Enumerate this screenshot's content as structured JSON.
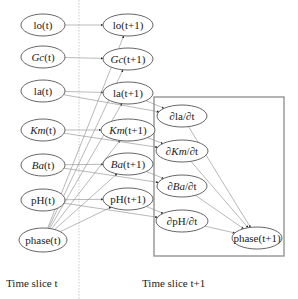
{
  "diagram": {
    "type": "dynamic-bayesian-network",
    "slice_labels": {
      "t": "Time slice t",
      "t_plus_1": "Time slice t+1"
    },
    "divider_x": 79,
    "box": {
      "x": 154,
      "y": 97,
      "w": 130,
      "h": 159
    },
    "colors": {
      "edge": "#8a8a8a",
      "node_stroke": "#555555",
      "box_stroke": "#8c8c8c",
      "background": "#ffffff"
    },
    "nodes": [
      {
        "id": "lo_t",
        "italic": "",
        "rest": "lo(t)",
        "cx": 43,
        "cy": 25,
        "rx": 22,
        "ry": 11
      },
      {
        "id": "Gc_t",
        "italic": "Gc",
        "rest": "(t)",
        "cx": 43,
        "cy": 57,
        "rx": 22,
        "ry": 11
      },
      {
        "id": "la_t",
        "italic": "",
        "rest": "la(t)",
        "cx": 43,
        "cy": 91,
        "rx": 22,
        "ry": 11
      },
      {
        "id": "Km_t",
        "italic": "Km",
        "rest": "(t)",
        "cx": 43,
        "cy": 130,
        "rx": 22,
        "ry": 11
      },
      {
        "id": "Ba_t",
        "italic": "Ba",
        "rest": "(t)",
        "cx": 43,
        "cy": 165,
        "rx": 22,
        "ry": 11
      },
      {
        "id": "pH_t",
        "italic": "",
        "rest": "pH(t)",
        "cx": 43,
        "cy": 200,
        "rx": 22,
        "ry": 11
      },
      {
        "id": "phase_t",
        "italic": "",
        "rest": "phase(t)",
        "cx": 43,
        "cy": 240,
        "rx": 24,
        "ry": 12
      },
      {
        "id": "lo_t1",
        "italic": "",
        "rest": "lo(t+1)",
        "cx": 128,
        "cy": 25,
        "rx": 25,
        "ry": 11
      },
      {
        "id": "Gc_t1",
        "italic": "Gc",
        "rest": "(t+1)",
        "cx": 128,
        "cy": 59,
        "rx": 25,
        "ry": 11
      },
      {
        "id": "la_t1",
        "italic": "",
        "rest": "la(t+1)",
        "cx": 128,
        "cy": 93,
        "rx": 25,
        "ry": 11
      },
      {
        "id": "Km_t1",
        "italic": "Km",
        "rest": "(t+1)",
        "cx": 128,
        "cy": 130,
        "rx": 27,
        "ry": 11
      },
      {
        "id": "Ba_t1",
        "italic": "Ba",
        "rest": "(t+1)",
        "cx": 128,
        "cy": 164,
        "rx": 25,
        "ry": 11
      },
      {
        "id": "pH_t1",
        "italic": "",
        "rest": "pH(t+1)",
        "cx": 128,
        "cy": 199,
        "rx": 25,
        "ry": 11
      },
      {
        "id": "dla",
        "italic": "",
        "rest": "∂la/∂t",
        "pre": "",
        "cx": 182,
        "cy": 116,
        "rx": 25,
        "ry": 11
      },
      {
        "id": "dKm",
        "italic": "Km",
        "pre": "∂",
        "rest": "/∂t",
        "cx": 182,
        "cy": 151,
        "rx": 26,
        "ry": 11
      },
      {
        "id": "dBa",
        "italic": "Ba",
        "pre": "∂",
        "rest": "/∂t",
        "cx": 182,
        "cy": 186,
        "rx": 25,
        "ry": 11
      },
      {
        "id": "dpH",
        "italic": "",
        "rest": "∂pH/∂t",
        "pre": "",
        "cx": 182,
        "cy": 221,
        "rx": 26,
        "ry": 11
      },
      {
        "id": "phase_t1",
        "italic": "",
        "rest": "phase(t+1)",
        "cx": 257,
        "cy": 238,
        "rx": 25,
        "ry": 11
      }
    ],
    "edges": [
      [
        "lo_t",
        "lo_t1"
      ],
      [
        "Gc_t",
        "Gc_t1"
      ],
      [
        "la_t",
        "la_t1"
      ],
      [
        "Km_t",
        "Km_t1"
      ],
      [
        "Ba_t",
        "Ba_t1"
      ],
      [
        "pH_t",
        "pH_t1"
      ],
      [
        "phase_t",
        "lo_t1"
      ],
      [
        "phase_t",
        "Gc_t1"
      ],
      [
        "phase_t",
        "la_t1"
      ],
      [
        "phase_t",
        "Km_t1"
      ],
      [
        "phase_t",
        "Ba_t1"
      ],
      [
        "phase_t",
        "pH_t1"
      ],
      [
        "la_t",
        "dla"
      ],
      [
        "la_t1",
        "dla"
      ],
      [
        "Km_t",
        "dKm"
      ],
      [
        "Km_t1",
        "dKm"
      ],
      [
        "Ba_t",
        "dBa"
      ],
      [
        "Ba_t1",
        "dBa"
      ],
      [
        "pH_t",
        "dpH"
      ],
      [
        "pH_t1",
        "dpH"
      ],
      [
        "dla",
        "phase_t1"
      ],
      [
        "dKm",
        "phase_t1"
      ],
      [
        "dBa",
        "phase_t1"
      ],
      [
        "dpH",
        "phase_t1"
      ]
    ]
  }
}
